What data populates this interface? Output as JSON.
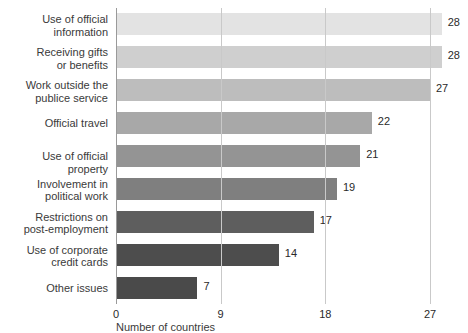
{
  "title_remnant": "",
  "axis_title": "Number of countries",
  "chart_data": {
    "type": "bar",
    "orientation": "horizontal",
    "title": "",
    "xlabel": "Number of countries",
    "ylabel": "",
    "xlim": [
      0,
      27
    ],
    "xticks": [
      0,
      9,
      18,
      27
    ],
    "grid": true,
    "legend": "none",
    "categories": [
      "Use of official\ninformation",
      "Receiving gifts\nor benefits",
      "Work outside the\npublice service",
      "Official travel",
      "Use of official property",
      "Involvement in\npolitical work",
      "Restrictions on\npost-employment",
      "Use of corporate\ncredit cards",
      "Other issues"
    ],
    "values": [
      28,
      28,
      27,
      22,
      21,
      19,
      17,
      14,
      7
    ],
    "value_labels": [
      "28",
      "28",
      "27",
      "22",
      "21",
      "19",
      "17",
      "14",
      "7"
    ],
    "bar_colors": [
      "#e3e3e3",
      "#cfcfcf",
      "#bdbdbd",
      "#a8a8a8",
      "#949494",
      "#7f7f7f",
      "#5e5e5e",
      "#4d4d4d",
      "#4a4a4a"
    ]
  }
}
